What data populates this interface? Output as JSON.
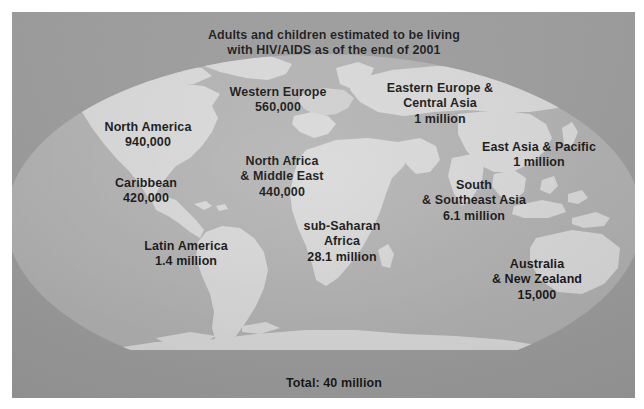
{
  "panel": {
    "background_color": "#9c9c9c",
    "ocean_color": "#b0b0b0",
    "land_color": "#d9d9d9",
    "text_color": "#111111"
  },
  "title": {
    "line1": "Adults and children estimated to be living",
    "line2": "with HIV/AIDS as of the end of 2001"
  },
  "regions": [
    {
      "id": "north-america",
      "name": "North America",
      "value": "940,000",
      "x": 136,
      "y": 108
    },
    {
      "id": "western-europe",
      "name": "Western Europe",
      "value": "560,000",
      "x": 266,
      "y": 73
    },
    {
      "id": "eastern-europe-central-asia",
      "name_line1": "Eastern Europe &",
      "name_line2": "Central Asia",
      "value": "1 million",
      "x": 428,
      "y": 69
    },
    {
      "id": "caribbean",
      "name": "Caribbean",
      "value": "420,000",
      "x": 134,
      "y": 164
    },
    {
      "id": "north-africa-middle-east",
      "name_line1": "North Africa",
      "name_line2": "& Middle East",
      "value": "440,000",
      "x": 270,
      "y": 142
    },
    {
      "id": "east-asia-pacific",
      "name": "East Asia & Pacific",
      "value": "1 million",
      "x": 527,
      "y": 128
    },
    {
      "id": "south-southeast-asia",
      "name_line1": "South",
      "name_line2": "& Southeast Asia",
      "value": "6.1 million",
      "x": 462,
      "y": 166
    },
    {
      "id": "latin-america",
      "name": "Latin America",
      "value": "1.4 million",
      "x": 174,
      "y": 227
    },
    {
      "id": "sub-saharan-africa",
      "name_line1": "sub-Saharan",
      "name_line2": "Africa",
      "value": "28.1 million",
      "x": 330,
      "y": 207
    },
    {
      "id": "australia-new-zealand",
      "name_line1": "Australia",
      "name_line2": "& New Zealand",
      "value": "15,000",
      "x": 525,
      "y": 245
    }
  ],
  "total": {
    "label": "Total: 40 million"
  }
}
